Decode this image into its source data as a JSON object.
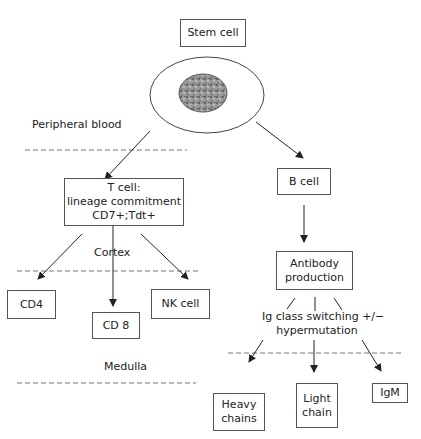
{
  "diagram": {
    "nodes": {
      "stem_cell": "Stem cell",
      "t_cell_line1": "T cell:",
      "t_cell_line2": "lineage commitment",
      "t_cell_line3": "CD7+;Tdt+",
      "b_cell": "B cell",
      "antibody_line1": "Antibody",
      "antibody_line2": "production",
      "cd4": "CD4",
      "cd8": "CD 8",
      "nk_cell": "NK cell",
      "heavy_line1": "Heavy",
      "heavy_line2": "chains",
      "light_line1": "Light",
      "light_line2": "chain",
      "igm": "IgM"
    },
    "labels": {
      "peripheral_blood": "Peripheral blood",
      "cortex": "Cortex",
      "medulla": "Medulla",
      "ig_switch_line1": "Ig class switching +/−",
      "ig_switch_line2": "hypermutation"
    },
    "colors": {
      "line": "#333333",
      "dashed": "#777777",
      "nucleus": "#8a8a8a"
    }
  }
}
